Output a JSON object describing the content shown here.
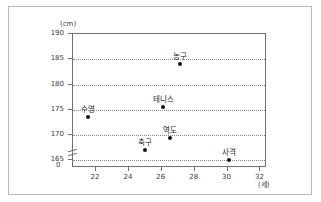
{
  "chart_data": {
    "type": "scatter",
    "title": "",
    "xlabel": "(세)",
    "ylabel": "(cm)",
    "xlim": [
      20.6,
      32.4
    ],
    "ylim": [
      163.5,
      190
    ],
    "xticks": [
      "22",
      "24",
      "26",
      "28",
      "30",
      "32"
    ],
    "xtick_values": [
      22,
      24,
      26,
      28,
      30,
      32
    ],
    "yticks": [
      "165",
      "170",
      "175",
      "180",
      "185",
      "190"
    ],
    "ytick_values": [
      165,
      170,
      175,
      180,
      185,
      190
    ],
    "y_axis_break": true,
    "y_origin_label": "0",
    "grid": "horizontal-dotted",
    "legend": "none",
    "points": [
      {
        "label": "수영",
        "x": 21.5,
        "y": 173.5
      },
      {
        "label": "축구",
        "x": 25.0,
        "y": 167.0
      },
      {
        "label": "테니스",
        "x": 26.1,
        "y": 175.5
      },
      {
        "label": "역도",
        "x": 26.5,
        "y": 169.5
      },
      {
        "label": "농구",
        "x": 27.1,
        "y": 184.0
      },
      {
        "label": "사격",
        "x": 30.1,
        "y": 165.0
      }
    ]
  },
  "colors": {
    "point": "#111111",
    "axis": "#707070",
    "grid": "#8a8a8a",
    "border": "#b9b9b9",
    "text": "#2b2b2b"
  }
}
